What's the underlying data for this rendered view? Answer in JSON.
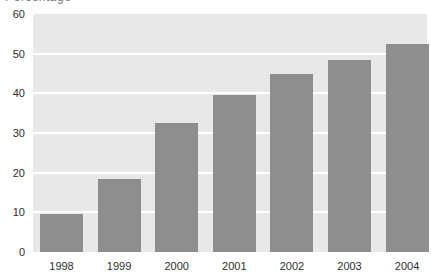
{
  "figure": {
    "cropped_title_fragment": "Percentage",
    "colors": {
      "bar": "#8e8e8e",
      "plot_bg": "#e8e8e8",
      "gridline": "#ffffff",
      "page_bg": "#ffffff",
      "text": "#2e2e2e"
    }
  },
  "chart_data": {
    "type": "bar",
    "categories": [
      "1998",
      "1999",
      "2000",
      "2001",
      "2002",
      "2003",
      "2004"
    ],
    "values": [
      9.5,
      18.5,
      32.5,
      39.5,
      45,
      48.5,
      52.5
    ],
    "title": "",
    "xlabel": "",
    "ylabel": "",
    "ylim": [
      0,
      60
    ],
    "yticks": [
      0,
      10,
      20,
      30,
      40,
      50,
      60
    ],
    "gridline_values": [
      10,
      20,
      30,
      40,
      50
    ],
    "legend": "none",
    "grid": "horizontal white lines on light gray plot background"
  }
}
